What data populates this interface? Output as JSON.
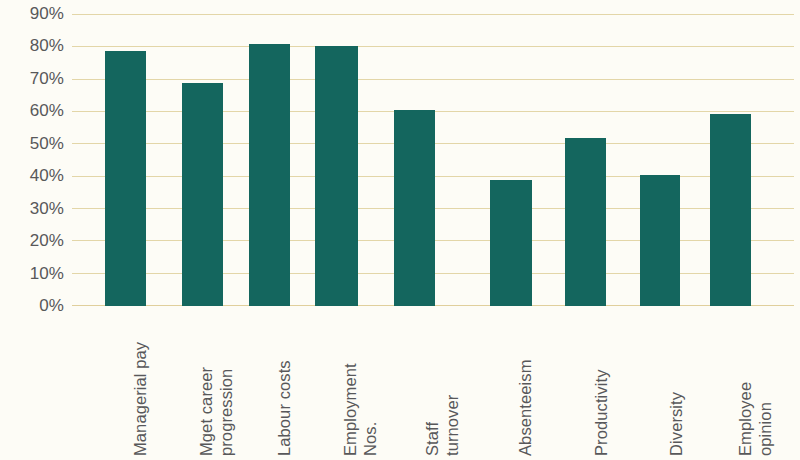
{
  "chart_data": {
    "type": "bar",
    "title": "",
    "subtitle": "",
    "xlabel": "",
    "ylabel": "",
    "categories": [
      "Managerial pay",
      "Mget career progression",
      "Labour costs",
      "Employment Nos.",
      "Staff turnover",
      "Absenteeism",
      "Productivity",
      "Diversity",
      "Employee opinion"
    ],
    "category_lines": [
      [
        "Managerial pay"
      ],
      [
        "Mget career",
        "progression"
      ],
      [
        "Labour costs"
      ],
      [
        "Employment",
        "Nos."
      ],
      [
        "Staff",
        "turnover"
      ],
      [
        "Absenteeism"
      ],
      [
        "Productivity"
      ],
      [
        "Diversity"
      ],
      [
        "Employee",
        "opinion"
      ]
    ],
    "values": [
      79,
      69,
      81,
      80.5,
      60.5,
      39,
      52,
      40.5,
      59.5
    ],
    "value_labels": [
      "79%",
      "69%",
      "81%",
      "81%",
      "60%",
      "39%",
      "52%",
      "40%",
      "60%"
    ],
    "ylim": [
      0,
      90
    ],
    "ytick_values": [
      90,
      80,
      70,
      60,
      50,
      40,
      30,
      20,
      10,
      0
    ],
    "ytick_labels": [
      "90%",
      "80%",
      "70%",
      "60%",
      "50%",
      "40%",
      "30%",
      "20%",
      "10%",
      "0%"
    ],
    "grid": true,
    "legend": false,
    "legend_position": "none",
    "colors": {
      "bar": "#14665e",
      "gridline": "#e3d6a8",
      "background": "#fdfcf6",
      "text": "#58585a"
    }
  }
}
